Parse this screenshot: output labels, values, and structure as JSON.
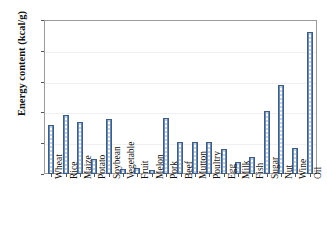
{
  "chart_data": {
    "type": "bar",
    "title": "",
    "xlabel": "",
    "ylabel": "Energy content (kcal/g)",
    "ylim": [
      0,
      10
    ],
    "yticks": [
      0,
      2,
      4,
      6,
      8,
      10
    ],
    "grid": true,
    "legend": null,
    "categories": [
      "Wheat",
      "Rice",
      "Maize",
      "Potato",
      "Soybean",
      "Vegetable",
      "Fruit",
      "Melon",
      "Pork",
      "Beef",
      "Mutton",
      "Poultry",
      "Egg",
      "Milk",
      "Fish",
      "Sugar",
      "Nut",
      "Wine",
      "Oil"
    ],
    "values": [
      3.2,
      3.8,
      3.4,
      1.0,
      3.6,
      0.3,
      0.4,
      0.25,
      3.65,
      2.1,
      2.1,
      2.1,
      1.6,
      0.8,
      1.1,
      4.1,
      5.8,
      1.7,
      9.2
    ],
    "series": [
      {
        "name": "Energy content",
        "values": [
          3.2,
          3.8,
          3.4,
          1.0,
          3.6,
          0.3,
          0.4,
          0.25,
          3.65,
          2.1,
          2.1,
          2.1,
          1.6,
          0.8,
          1.1,
          4.1,
          5.8,
          1.7,
          9.2
        ]
      }
    ],
    "colors": {
      "bar_fill": "#c4d4e8",
      "bar_edge": "#3f5d80",
      "axis": "#555555",
      "frame": "#9a9a9a",
      "gridline": "#f0f0f0",
      "text": "#111111",
      "background": "#ffffff"
    }
  }
}
